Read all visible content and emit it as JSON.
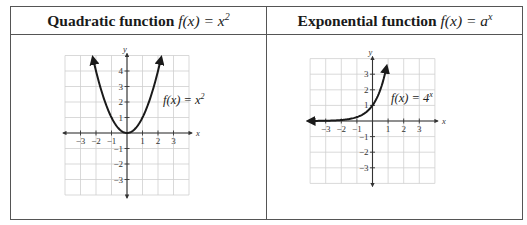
{
  "table": {
    "columns": [
      {
        "header_bold": "Quadratic function",
        "header_math": "f(x) = x",
        "header_exp": "2"
      },
      {
        "header_bold": "Exponential function",
        "header_math": "f(x) = a",
        "header_exp": "x"
      }
    ]
  },
  "chart_data": [
    {
      "type": "line",
      "title": "Quadratic function f(x) = x^2",
      "function": "f(x) = x^2",
      "annotation": "f(x) = x^2",
      "xlabel": "x",
      "ylabel": "y",
      "xlim": [
        -4,
        4
      ],
      "ylim": [
        -4,
        5
      ],
      "x_ticks": [
        -3,
        -2,
        -1,
        1,
        2,
        3
      ],
      "y_ticks": [
        -3,
        -2,
        -1,
        1,
        2,
        3,
        4
      ],
      "grid": true,
      "x": [
        -2.2,
        -2,
        -1.5,
        -1,
        -0.5,
        0,
        0.5,
        1,
        1.5,
        2,
        2.2
      ],
      "y": [
        4.84,
        4,
        2.25,
        1,
        0.25,
        0,
        0.25,
        1,
        2.25,
        4,
        4.84
      ],
      "arrows": "both ends of curve, both ends of axes"
    },
    {
      "type": "line",
      "title": "Exponential function f(x) = a^x",
      "function": "f(x) = 4^x",
      "annotation": "f(x) = 4^x",
      "xlabel": "x",
      "ylabel": "y",
      "xlim": [
        -4,
        4
      ],
      "ylim": [
        -4,
        4
      ],
      "x_ticks": [
        -3,
        -2,
        -1,
        1,
        2,
        3
      ],
      "y_ticks": [
        -3,
        -2,
        -1,
        1,
        2,
        3
      ],
      "grid": true,
      "x": [
        -4,
        -3,
        -2,
        -1.5,
        -1,
        -0.5,
        0,
        0.5,
        0.75,
        0.9
      ],
      "y": [
        0.004,
        0.016,
        0.0625,
        0.125,
        0.25,
        0.5,
        1,
        2,
        2.83,
        3.48
      ],
      "arrows": "both ends of curve, both ends of axes"
    }
  ],
  "graphs": {
    "left": {
      "x_tick_labels": [
        "−3",
        "−2",
        "−1",
        "1",
        "2",
        "3"
      ],
      "y_tick_labels": [
        "4",
        "3",
        "2",
        "1",
        "−1",
        "−2",
        "−3"
      ],
      "x_axis_name": "x",
      "y_axis_name": "y",
      "fn_main": "f(x) = x",
      "fn_exp": "2"
    },
    "right": {
      "x_tick_labels": [
        "−3",
        "−2",
        "−1",
        "1",
        "2",
        "3"
      ],
      "y_tick_labels": [
        "3",
        "2",
        "1",
        "−1",
        "−2",
        "−3"
      ],
      "x_axis_name": "x",
      "y_axis_name": "y",
      "fn_main": "f(x) = 4",
      "fn_exp": "x"
    }
  },
  "colors": {
    "border": "#555555",
    "grid": "#cfcfcf",
    "axis": "#333333",
    "curve": "#1a1a1a"
  }
}
